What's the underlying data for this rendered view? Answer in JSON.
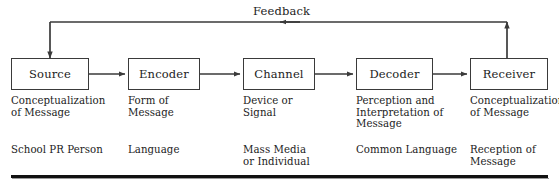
{
  "diagram": {
    "feedback_label": "Feedback",
    "line_color": "#3a3a3a",
    "text_color": "#1c1c1c",
    "box_border_color": "#3a3a3a",
    "background": "#ffffff",
    "nodes": [
      {
        "id": "source",
        "label": "Source",
        "description": "Conceptualization\nof Message",
        "example": "School PR Person",
        "x": 11,
        "y": 58,
        "w": 78,
        "h": 32
      },
      {
        "id": "encoder",
        "label": "Encoder",
        "description": "Form of\nMessage",
        "example": "Language",
        "x": 128,
        "y": 58,
        "w": 72,
        "h": 32
      },
      {
        "id": "channel",
        "label": "Channel",
        "description": "Device or\nSignal",
        "example": "Mass Media\nor Individual",
        "x": 243,
        "y": 58,
        "w": 72,
        "h": 32
      },
      {
        "id": "decoder",
        "label": "Decoder",
        "description": "Perception and\nInterpretation of\nMessage",
        "example": "Common Language",
        "x": 356,
        "y": 58,
        "w": 77,
        "h": 32
      },
      {
        "id": "receiver",
        "label": "Receiver",
        "description": "Conceptualization\nof Message",
        "example": "Reception of\nMessage",
        "x": 470,
        "y": 58,
        "w": 78,
        "h": 32
      }
    ],
    "flow_connectors": [
      {
        "from": "source",
        "to": "encoder"
      },
      {
        "from": "encoder",
        "to": "channel"
      },
      {
        "from": "channel",
        "to": "decoder"
      },
      {
        "from": "decoder",
        "to": "receiver"
      }
    ],
    "feedback_path": {
      "from": "receiver",
      "to": "source",
      "direction": "right-to-left"
    }
  }
}
